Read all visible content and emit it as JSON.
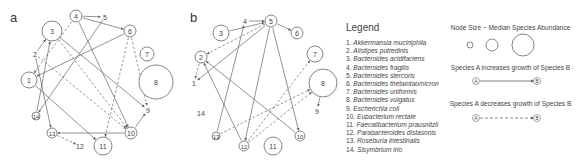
{
  "panels": [
    {
      "label": "a"
    },
    {
      "label": "b"
    }
  ],
  "legend": {
    "title": "Legend",
    "species": [
      {
        "num": "1.",
        "name": "Akkermansia muciniphila"
      },
      {
        "num": "2.",
        "name": "Alistipes putredinis"
      },
      {
        "num": "3.",
        "name": "Bacteroides acidifaciens"
      },
      {
        "num": "4.",
        "name": "Bacteroides fragilis"
      },
      {
        "num": "5.",
        "name": "Bacteroides stercoris"
      },
      {
        "num": "6.",
        "name": "Bacteroides thetaiotaomicron"
      },
      {
        "num": "7.",
        "name": "Bacteroides uniformis"
      },
      {
        "num": "8.",
        "name": "Bacteroides vulgatus"
      },
      {
        "num": "9.",
        "name": "Escherichia coli"
      },
      {
        "num": "10.",
        "name": "Eubacterium rectale"
      },
      {
        "num": "11.",
        "name": "Faecalibacterium prausnitzii"
      },
      {
        "num": "12.",
        "name": "Parabacteroides distasonis"
      },
      {
        "num": "13.",
        "name": "Roseburia intestinalis"
      },
      {
        "num": "14.",
        "name": "Sisymbrium irio"
      }
    ],
    "node_size_title": "Node Size ~ Median Species Abundance",
    "increase_title": "Species A increases growth of Species B",
    "decrease_title": "Species A decreases growth of Species B",
    "node_a": "A",
    "node_b": "B"
  },
  "colors": {
    "stroke": "#666666",
    "text": "#444444"
  },
  "graph_a": {
    "nodes": [
      {
        "id": "1",
        "x": 29,
        "y": 80,
        "r": 8
      },
      {
        "id": "2",
        "x": 35,
        "y": 54,
        "r": 0
      },
      {
        "id": "3",
        "x": 52,
        "y": 31,
        "r": 10
      },
      {
        "id": "4",
        "x": 76,
        "y": 16,
        "r": 6
      },
      {
        "id": "5",
        "x": 105,
        "y": 17,
        "r": 0
      },
      {
        "id": "6",
        "x": 130,
        "y": 31,
        "r": 6
      },
      {
        "id": "7",
        "x": 147,
        "y": 54,
        "r": 7
      },
      {
        "id": "8",
        "x": 156,
        "y": 82,
        "r": 17
      },
      {
        "id": "9",
        "x": 148,
        "y": 110,
        "r": 0
      },
      {
        "id": "10",
        "x": 131,
        "y": 133,
        "r": 6
      },
      {
        "id": "11",
        "x": 103,
        "y": 146,
        "r": 9
      },
      {
        "id": "12",
        "x": 80,
        "y": 146,
        "r": 0
      },
      {
        "id": "13",
        "x": 52,
        "y": 133,
        "r": 5
      },
      {
        "id": "14",
        "x": 36,
        "y": 116,
        "r": 4
      }
    ],
    "edges": [
      {
        "from": "4",
        "to": "5",
        "type": "increase"
      },
      {
        "from": "4",
        "to": "6",
        "type": "increase"
      },
      {
        "from": "4",
        "to": "10",
        "type": "increase"
      },
      {
        "from": "3",
        "to": "9",
        "type": "increase"
      },
      {
        "from": "6",
        "to": "1",
        "type": "increase"
      },
      {
        "from": "5",
        "to": "14",
        "type": "increase"
      },
      {
        "from": "1",
        "to": "11",
        "type": "increase"
      },
      {
        "from": "2",
        "to": "3",
        "type": "increase"
      },
      {
        "from": "14",
        "to": "3",
        "type": "increase"
      },
      {
        "from": "2",
        "to": "13",
        "type": "increase"
      },
      {
        "from": "10",
        "to": "13",
        "type": "increase"
      },
      {
        "from": "10",
        "to": "9",
        "type": "increase"
      },
      {
        "from": "6",
        "to": "9",
        "type": "decrease"
      },
      {
        "from": "6",
        "to": "11",
        "type": "decrease"
      },
      {
        "from": "2",
        "to": "10",
        "type": "decrease"
      },
      {
        "from": "4",
        "to": "1",
        "type": "decrease"
      },
      {
        "from": "13",
        "to": "12",
        "type": "decrease"
      },
      {
        "from": "3",
        "to": "10",
        "type": "decrease"
      }
    ]
  },
  "graph_b": {
    "nodes": [
      {
        "id": "1",
        "x": 194,
        "y": 83,
        "r": 0
      },
      {
        "id": "2",
        "x": 201,
        "y": 57,
        "r": 6
      },
      {
        "id": "3",
        "x": 221,
        "y": 33,
        "r": 8
      },
      {
        "id": "4",
        "x": 245,
        "y": 21,
        "r": 0
      },
      {
        "id": "5",
        "x": 271,
        "y": 21,
        "r": 6
      },
      {
        "id": "6",
        "x": 297,
        "y": 33,
        "r": 6
      },
      {
        "id": "7",
        "x": 315,
        "y": 54,
        "r": 8
      },
      {
        "id": "8",
        "x": 323,
        "y": 83,
        "r": 14
      },
      {
        "id": "9",
        "x": 317,
        "y": 111,
        "r": 0
      },
      {
        "id": "10",
        "x": 300,
        "y": 136,
        "r": 5
      },
      {
        "id": "11",
        "x": 273,
        "y": 146,
        "r": 9
      },
      {
        "id": "12",
        "x": 244,
        "y": 146,
        "r": 5
      },
      {
        "id": "13",
        "x": 216,
        "y": 136,
        "r": 4
      },
      {
        "id": "14",
        "x": 201,
        "y": 113,
        "r": 0
      }
    ],
    "edges": [
      {
        "from": "4",
        "to": "5",
        "type": "increase"
      },
      {
        "from": "3",
        "to": "5",
        "type": "increase"
      },
      {
        "from": "5",
        "to": "6",
        "type": "increase"
      },
      {
        "from": "5",
        "to": "1",
        "type": "increase"
      },
      {
        "from": "5",
        "to": "12",
        "type": "increase"
      },
      {
        "from": "5",
        "to": "10",
        "type": "increase"
      },
      {
        "from": "13",
        "to": "4",
        "type": "increase"
      },
      {
        "from": "12",
        "to": "2",
        "type": "increase"
      },
      {
        "from": "10",
        "to": "2",
        "type": "increase"
      },
      {
        "from": "8",
        "to": "9",
        "type": "increase"
      },
      {
        "from": "2",
        "to": "1",
        "type": "decrease"
      },
      {
        "from": "5",
        "to": "2",
        "type": "decrease"
      },
      {
        "from": "12",
        "to": "8",
        "type": "decrease"
      },
      {
        "from": "13",
        "to": "8",
        "type": "decrease"
      },
      {
        "from": "12",
        "to": "7",
        "type": "decrease"
      }
    ]
  }
}
